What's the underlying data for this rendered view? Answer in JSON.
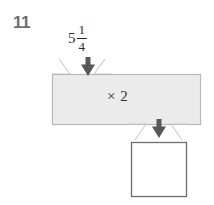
{
  "problem": {
    "number": "11"
  },
  "diagram": {
    "type": "function-machine",
    "input": {
      "label": "5 1/4",
      "whole": "5",
      "numerator": "1",
      "denominator": "4"
    },
    "operation": {
      "label": "× 2"
    },
    "output": {
      "label": "",
      "value": ""
    },
    "arrows": [
      {
        "name": "input-arrow",
        "direction": "down"
      },
      {
        "name": "output-arrow",
        "direction": "down"
      }
    ],
    "colors": {
      "machine_fill": "#ebebeb",
      "machine_stroke": "#b8b8b8",
      "funnel_stroke": "#cfcfcf",
      "answer_fill": "#ffffff",
      "answer_stroke": "#6e6e6e",
      "arrow_fill": "#585858",
      "text": "#2f2f2f",
      "number_text": "#6e6e6e",
      "background": "#ffffff"
    }
  }
}
